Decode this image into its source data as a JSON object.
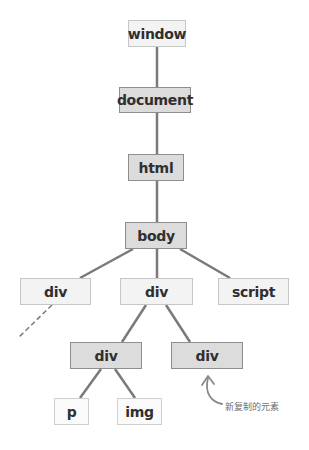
{
  "diagram": {
    "nodes": [
      {
        "id": "window",
        "label": "window",
        "style": "light",
        "x": 128,
        "y": 20,
        "w": 58,
        "h": 27
      },
      {
        "id": "document",
        "label": "document",
        "style": "dark",
        "x": 119,
        "y": 87,
        "w": 72,
        "h": 26
      },
      {
        "id": "html",
        "label": "html",
        "style": "dark",
        "x": 128,
        "y": 154,
        "w": 56,
        "h": 27
      },
      {
        "id": "body",
        "label": "body",
        "style": "dark",
        "x": 125,
        "y": 222,
        "w": 62,
        "h": 27
      },
      {
        "id": "div-left",
        "label": "div",
        "style": "light",
        "x": 20,
        "y": 278,
        "w": 71,
        "h": 27
      },
      {
        "id": "div-mid",
        "label": "div",
        "style": "light",
        "x": 120,
        "y": 278,
        "w": 73,
        "h": 27
      },
      {
        "id": "script",
        "label": "script",
        "style": "light",
        "x": 218,
        "y": 278,
        "w": 71,
        "h": 27
      },
      {
        "id": "div-child-left",
        "label": "div",
        "style": "dark",
        "x": 70,
        "y": 342,
        "w": 72,
        "h": 27
      },
      {
        "id": "div-child-right",
        "label": "div",
        "style": "dark",
        "x": 171,
        "y": 342,
        "w": 72,
        "h": 27
      },
      {
        "id": "p",
        "label": "p",
        "style": "white",
        "x": 54,
        "y": 398,
        "w": 35,
        "h": 27
      },
      {
        "id": "img",
        "label": "img",
        "style": "white",
        "x": 117,
        "y": 398,
        "w": 45,
        "h": 27
      }
    ],
    "edges": [
      {
        "from": "window",
        "to": "document",
        "x1": 157,
        "y1": 47,
        "x2": 157,
        "y2": 87
      },
      {
        "from": "document",
        "to": "html",
        "x1": 157,
        "y1": 113,
        "x2": 157,
        "y2": 154
      },
      {
        "from": "html",
        "to": "body",
        "x1": 157,
        "y1": 181,
        "x2": 157,
        "y2": 222
      },
      {
        "from": "body",
        "to": "div-left",
        "x1": 133,
        "y1": 249,
        "x2": 80,
        "y2": 278
      },
      {
        "from": "body",
        "to": "div-mid",
        "x1": 157,
        "y1": 249,
        "x2": 157,
        "y2": 278
      },
      {
        "from": "body",
        "to": "script",
        "x1": 180,
        "y1": 249,
        "x2": 230,
        "y2": 278
      },
      {
        "from": "div-mid",
        "to": "div-child-left",
        "x1": 146,
        "y1": 305,
        "x2": 122,
        "y2": 342
      },
      {
        "from": "div-mid",
        "to": "div-child-right",
        "x1": 166,
        "y1": 305,
        "x2": 190,
        "y2": 342
      },
      {
        "from": "div-child-left",
        "to": "p",
        "x1": 101,
        "y1": 369,
        "x2": 80,
        "y2": 398
      },
      {
        "from": "div-child-left",
        "to": "img",
        "x1": 115,
        "y1": 369,
        "x2": 135,
        "y2": 398
      }
    ],
    "dashed_edges": [
      {
        "from": "div-left",
        "to": "offscreen",
        "x1": 52,
        "y1": 305,
        "x2": 18,
        "y2": 338
      }
    ],
    "annotation": {
      "text": "新复制的元素",
      "target": "div-child-right",
      "arrow": "curved-up-arrow"
    },
    "colors": {
      "edge": "#7a7a7a",
      "dark_fill": "#dcdcdc",
      "light_fill": "#f3f3f3",
      "text": "#2f2f2f",
      "annotation": "#6e6e6e"
    }
  }
}
